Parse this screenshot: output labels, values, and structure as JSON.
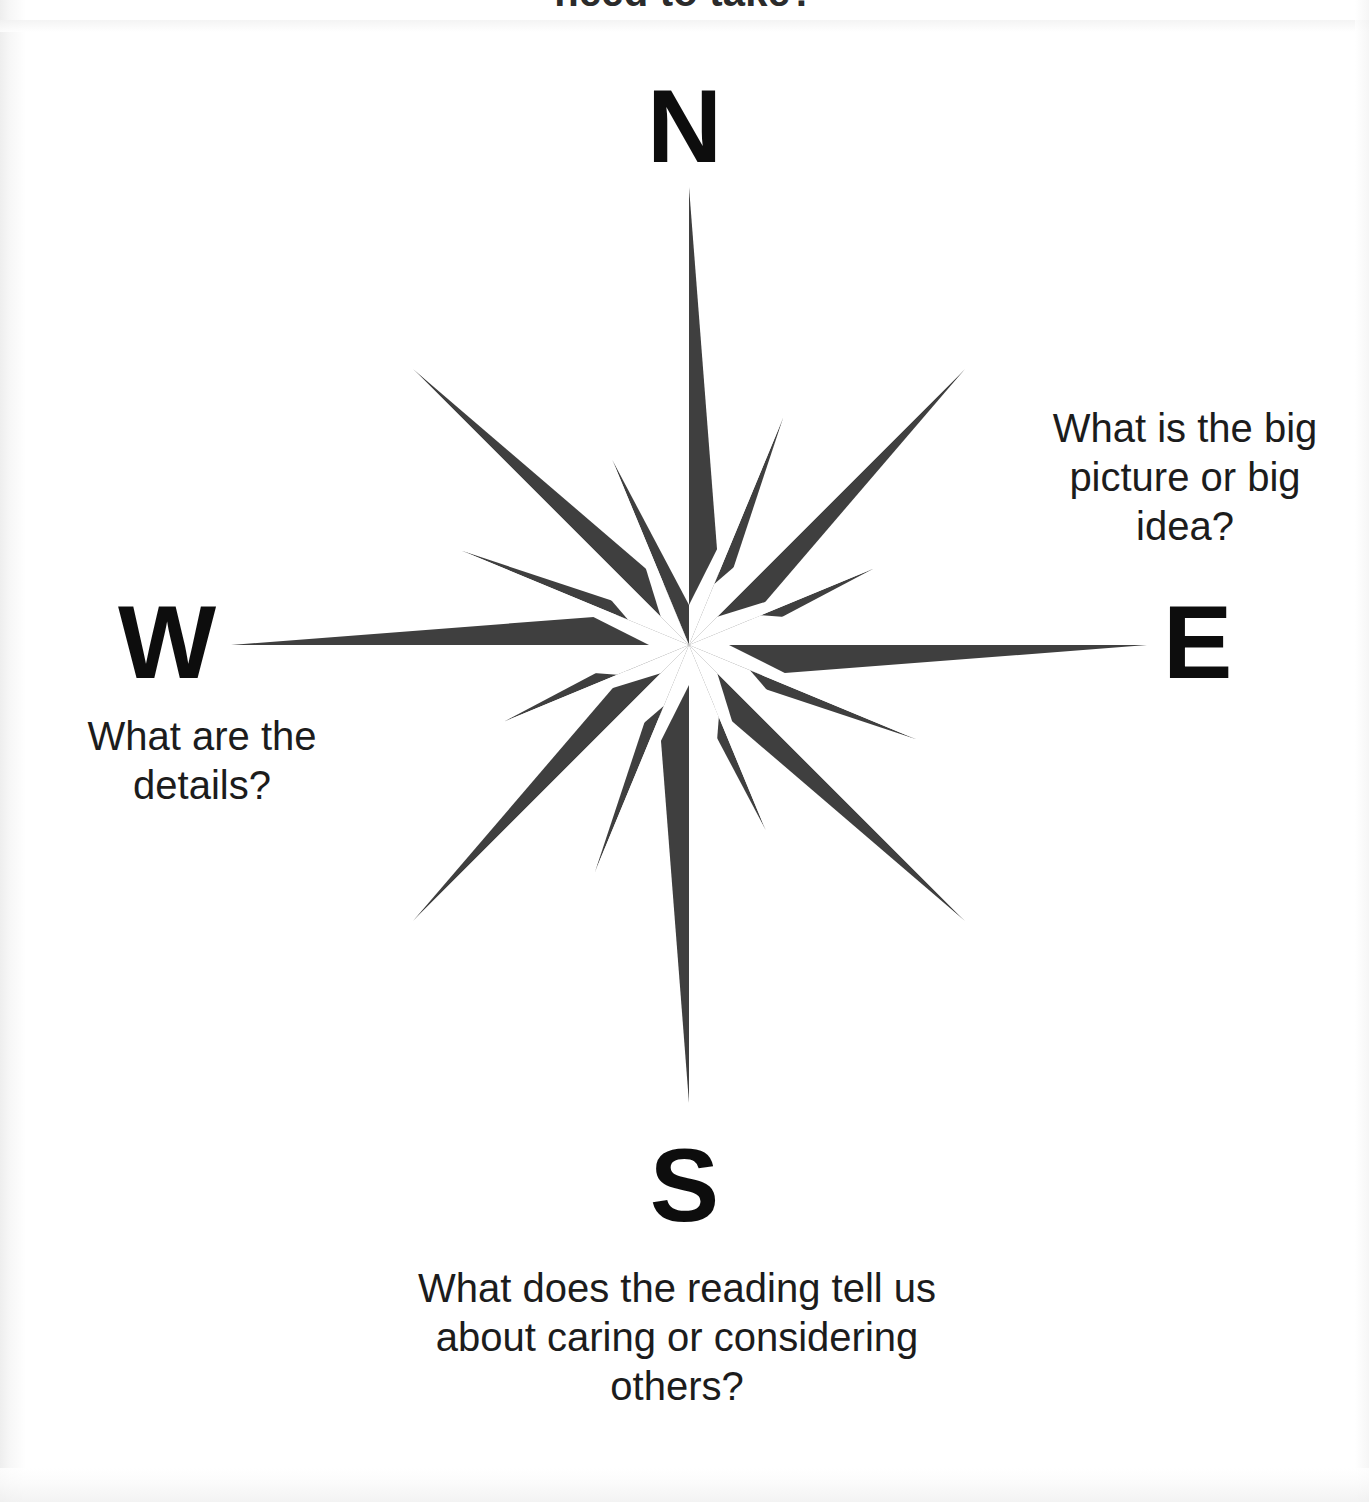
{
  "page": {
    "background_color": "#ffffff",
    "clipped_heading": "need to take?"
  },
  "compass": {
    "fill_color": "#3f3f3f",
    "center": {
      "x": 688,
      "y": 645
    },
    "points": 16,
    "cardinals": {
      "north": "N",
      "south": "S",
      "west": "W",
      "east": "E"
    },
    "prompts": {
      "northeast": "What is the big picture or big idea?",
      "west": "What are the details?",
      "south": "What does the reading tell us about caring or considering others?"
    }
  }
}
